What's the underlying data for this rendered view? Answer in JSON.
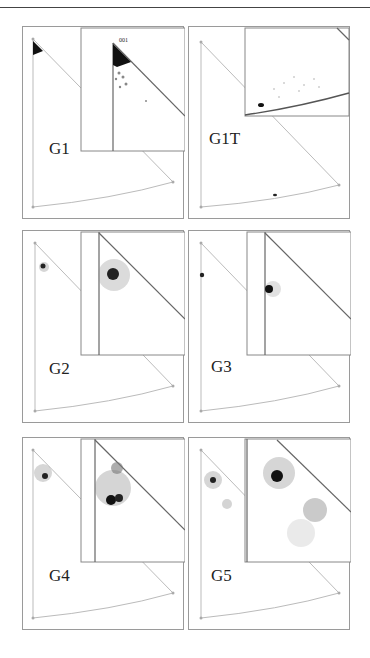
{
  "figure": {
    "panels": [
      {
        "id": "G1",
        "label": "G1",
        "inset_pole_label": "001"
      },
      {
        "id": "G1T",
        "label": "G1T"
      },
      {
        "id": "G2",
        "label": "G2"
      },
      {
        "id": "G3",
        "label": "G3"
      },
      {
        "id": "G4",
        "label": "G4"
      },
      {
        "id": "G5",
        "label": "G5"
      }
    ]
  },
  "colors": {
    "frame": "#9a9a9a",
    "triangle": "#b0b0b0",
    "inset_edge": "#666666",
    "points": "#222222"
  }
}
